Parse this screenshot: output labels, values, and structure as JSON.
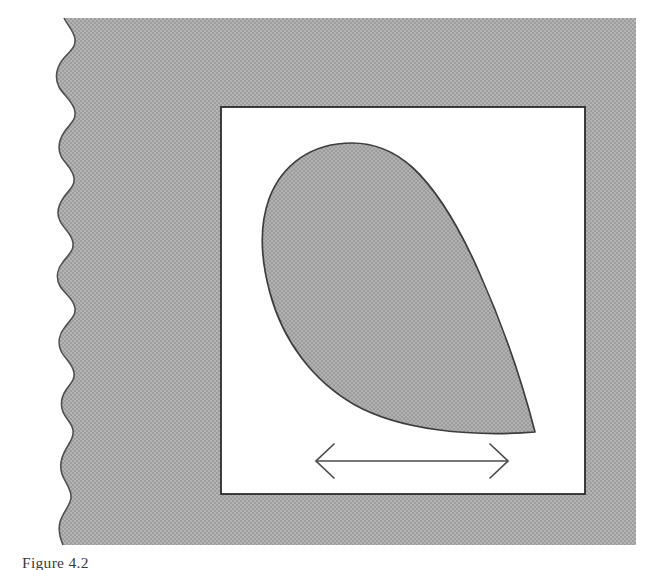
{
  "page": {
    "background_color": "#ffffff",
    "width": 648,
    "height": 570
  },
  "figure": {
    "name": "teardrop-airfoil-diagram",
    "plate": {
      "fill_color": "#ababab",
      "texture": "halftone-dither-grey",
      "left_edge_style": "torn-wavy-paper-edge",
      "top": 18,
      "right": 637,
      "bottom": 545
    },
    "inner_panel": {
      "name": "white-drawing-panel",
      "fill_color": "#ffffff",
      "stroke_color": "#2b2b2b",
      "x": 221,
      "y": 107,
      "width": 364,
      "height": 387
    },
    "shape": {
      "name": "teardrop",
      "description": "Shaded teardrop / raindrop cross-section with rounded bulb upper-left and sharp trailing point at lower-right",
      "fill_color": "#ababab",
      "stroke_color": "#3a3a3a",
      "tip_point": [
        535,
        432
      ],
      "bulb_leftmost": [
        263,
        268
      ],
      "bulb_top": [
        352,
        143
      ]
    },
    "arrow": {
      "name": "chord-length-double-arrow",
      "style": "double-headed-open-arrow",
      "stroke_color": "#4a4a4a",
      "x_start": 316,
      "x_end": 508,
      "y": 461,
      "label": ""
    }
  },
  "caption": {
    "text": "Figure 4.2",
    "clipped": true
  }
}
